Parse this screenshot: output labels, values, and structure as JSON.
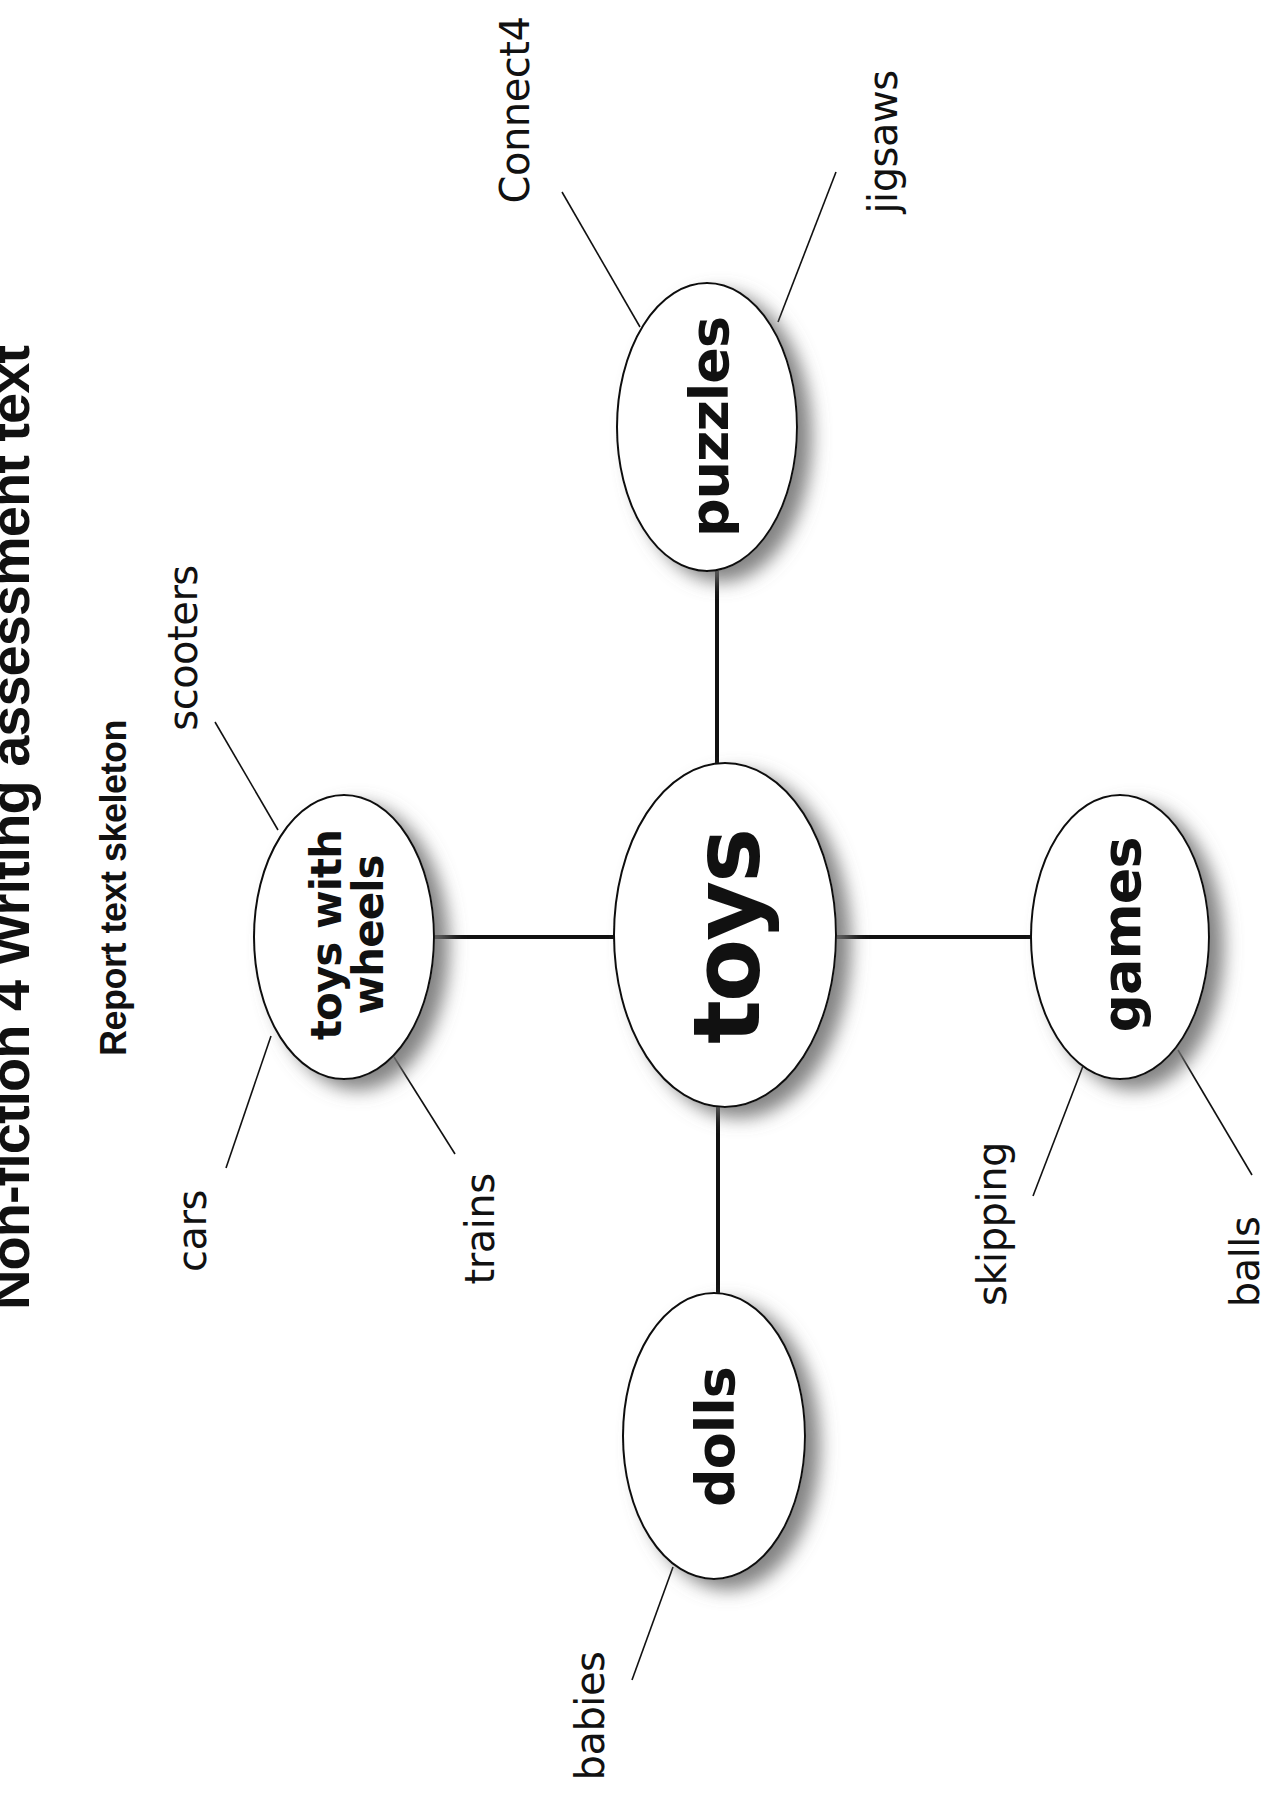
{
  "page": {
    "title": "Non-fiction 4 Writing assessment text",
    "subtitle": "Report text skeleton"
  },
  "colors": {
    "background": "#ffffff",
    "ink": "#111111",
    "shadow": "#7a7a7a"
  },
  "mind_map": {
    "center": {
      "label": "toys"
    },
    "branches": [
      {
        "id": "toys-with-wheels",
        "label_line1": "toys with",
        "label_line2": "wheels",
        "leaves": [
          "scooters",
          "cars",
          "trains"
        ]
      },
      {
        "id": "puzzles",
        "label": "puzzles",
        "leaves": [
          "Connect4",
          "jigsaws"
        ]
      },
      {
        "id": "games",
        "label": "games",
        "leaves": [
          "skipping",
          "balls"
        ]
      },
      {
        "id": "dolls",
        "label": "dolls",
        "leaves": [
          "babies"
        ]
      }
    ]
  }
}
